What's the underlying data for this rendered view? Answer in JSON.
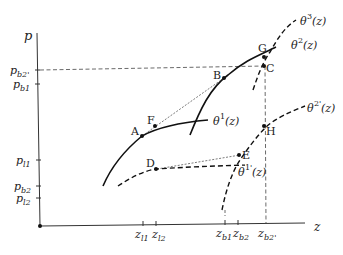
{
  "diagram": {
    "axes": {
      "y_label": "p",
      "x_label": "z",
      "y_ticks": [
        "p_{b2'}",
        "p_{b1}",
        "p_{l1}",
        "p_{b2}",
        "p_{l2}"
      ],
      "x_ticks": [
        "z_{l1}",
        "z_{l2}",
        "z_{b1}",
        "z_{b2}",
        "z_{b2'}"
      ]
    },
    "curves": [
      {
        "name": "θ¹(z)",
        "style": "solid"
      },
      {
        "name": "θ²(z)",
        "style": "solid"
      },
      {
        "name": "θ³(z)",
        "style": "dashed"
      },
      {
        "name": "θ¹'(z)",
        "style": "dashed"
      },
      {
        "name": "θ²'(z)",
        "style": "dashed"
      }
    ],
    "points": [
      "A",
      "B",
      "C",
      "D",
      "E",
      "F",
      "G",
      "H"
    ],
    "labels": {
      "p": "p",
      "z": "z",
      "pb2p_base": "p",
      "pb2p_sub": "b2'",
      "pb1_base": "p",
      "pb1_sub": "b1",
      "pl1_base": "p",
      "pl1_sub": "l1",
      "pb2_base": "p",
      "pb2_sub": "b2",
      "pl2_base": "p",
      "pl2_sub": "l2",
      "zl1_base": "z",
      "zl1_sub": "l1",
      "zl2_base": "z",
      "zl2_sub": "l2",
      "zb1_base": "z",
      "zb1_sub": "b1",
      "zb2_base": "z",
      "zb2_sub": "b2",
      "zb2p_base": "z",
      "zb2p_sub": "b2'",
      "theta": "θ",
      "sup1": "1",
      "sup2": "2",
      "sup3": "3",
      "sup1p": "1'",
      "sup2p": "2'",
      "arg": "(z)",
      "A": "A",
      "B": "B",
      "C": "C",
      "D": "D",
      "E": "E",
      "F": "F",
      "G": "G",
      "H": "H"
    }
  }
}
